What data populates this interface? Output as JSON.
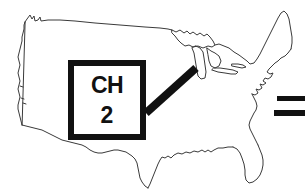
{
  "figure": {
    "type": "line-drawing-map",
    "background_color": "#ffffff",
    "ink_color": "#111111",
    "outline_stroke_color": "#3a3a3a",
    "width": 305,
    "height": 193
  },
  "callout": {
    "name": "channel-callout-box",
    "line_1": "CH",
    "line_2": "2",
    "border_color": "#111111",
    "fill_color": "#ffffff",
    "x": 68,
    "y": 60,
    "width": 78,
    "height": 80
  },
  "leader": {
    "name": "callout-leader-line",
    "from_x": 146,
    "from_y": 113,
    "to_x": 196,
    "to_y": 68,
    "color": "#111111",
    "thickness": 8,
    "points_to": "Great Lakes / Chicago region"
  },
  "edge_marks": [
    {
      "name": "edge-bar-upper",
      "x": 277,
      "y": 96,
      "width": 28,
      "height": 5,
      "color": "#111111"
    },
    {
      "name": "edge-bar-lower",
      "x": 274,
      "y": 110,
      "width": 31,
      "height": 6,
      "color": "#111111"
    }
  ],
  "map": {
    "name": "usa-outline",
    "regions_visible": [
      "Pacific Northwest",
      "California coast",
      "Northern border",
      "Great Lakes",
      "New England",
      "Atlantic coast",
      "Florida peninsula",
      "Gulf Coast",
      "Texas",
      "Mexican border"
    ]
  }
}
